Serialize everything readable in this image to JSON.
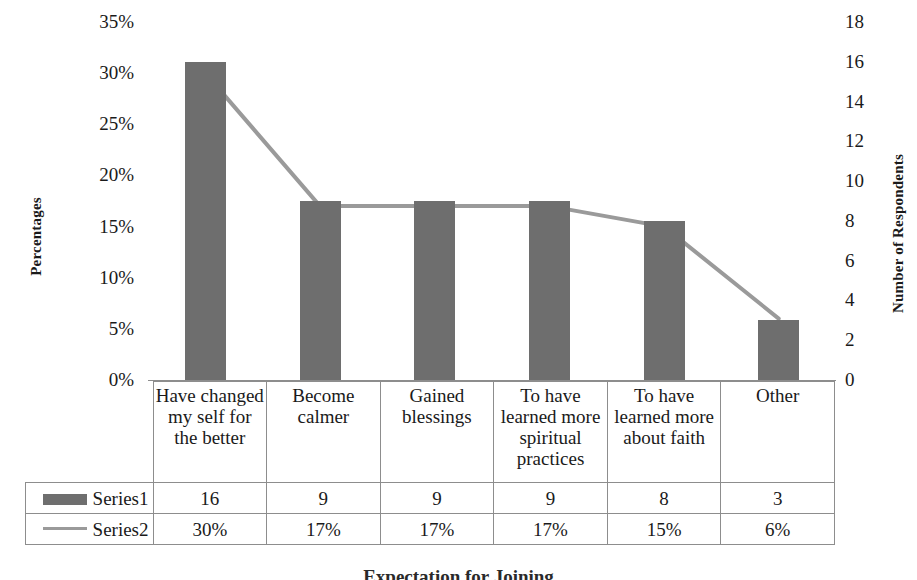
{
  "chart_data": {
    "type": "bar",
    "title": "",
    "xlabel": "",
    "ylabel": "Percentages",
    "y2label": "Number of Respondents",
    "categories": [
      "Have changed my self for the better",
      "Become calmer",
      "Gained blessings",
      "To have learned more spiritual practices",
      "To have learned more about faith",
      "Other"
    ],
    "series": [
      {
        "name": "Series1",
        "type": "bar",
        "axis": "right",
        "values": [
          16,
          9,
          9,
          9,
          8,
          3
        ],
        "labels": [
          "16",
          "9",
          "9",
          "9",
          "8",
          "3"
        ],
        "color": "#6e6e6e"
      },
      {
        "name": "Series2",
        "type": "line",
        "axis": "left",
        "values": [
          30,
          17,
          17,
          17,
          15,
          6
        ],
        "labels": [
          "30%",
          "17%",
          "17%",
          "17%",
          "15%",
          "6%"
        ],
        "color": "#9a9a9a"
      }
    ],
    "ylim": [
      0,
      35
    ],
    "yticks": [
      0,
      5,
      10,
      15,
      20,
      25,
      30,
      35
    ],
    "ytick_labels": [
      "0%",
      "5%",
      "10%",
      "15%",
      "20%",
      "25%",
      "30%",
      "35%"
    ],
    "y2lim": [
      0,
      18
    ],
    "y2ticks": [
      0,
      2,
      4,
      6,
      8,
      10,
      12,
      14,
      16,
      18
    ],
    "y2tick_labels": [
      "0",
      "2",
      "4",
      "6",
      "8",
      "10",
      "12",
      "14",
      "16",
      "18"
    ],
    "grid": false,
    "legend_position": "data-table-left"
  },
  "table": {
    "category_row": [
      "Have changed my self for the better",
      "Become calmer",
      "Gained blessings",
      "To have learned more spiritual practices",
      "To have learned more about faith",
      "Other"
    ],
    "rows": [
      {
        "label": "Series1",
        "swatch": "bar-swatch",
        "cells": [
          "16",
          "9",
          "9",
          "9",
          "8",
          "3"
        ]
      },
      {
        "label": "Series2",
        "swatch": "line-swatch",
        "cells": [
          "30%",
          "17%",
          "17%",
          "17%",
          "15%",
          "6%"
        ]
      }
    ]
  },
  "caption": "Expectation for Joining"
}
